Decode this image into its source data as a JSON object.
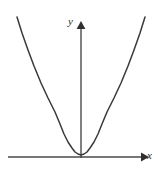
{
  "figure": {
    "name": "even-power-parabola-plot",
    "background_color": "#ffffff",
    "stroke_color": "#3a3a3a",
    "axis_color": "#4a4a4a"
  },
  "axes": {
    "x": {
      "label": "x",
      "arrow": "right-arrow-icon",
      "pixel_y": 157,
      "pixel_x_start": 8,
      "pixel_x_end": 148
    },
    "y": {
      "label": "y",
      "arrow": "up-arrow-icon",
      "pixel_x": 81,
      "pixel_y_start": 158,
      "pixel_y_end": 25
    },
    "origin": {
      "x": 81,
      "y": 157
    }
  },
  "chart_data": {
    "type": "line",
    "title": "",
    "xlabel": "x",
    "ylabel": "y",
    "grid": false,
    "legend": null,
    "annotations": [],
    "xlim": [
      -2.2,
      2.2
    ],
    "ylim": [
      0,
      22
    ],
    "axis_ticks": {
      "x": [],
      "y": []
    },
    "series": [
      {
        "name": "y = x^4 (steep even-power curve, vertex at origin)",
        "equation": "y = x^4",
        "x": [
          -2.05,
          -1.9,
          -1.75,
          -1.6,
          -1.45,
          -1.3,
          -1.15,
          -1.0,
          -0.85,
          -0.7,
          -0.55,
          -0.4,
          -0.25,
          0.0,
          0.25,
          0.4,
          0.55,
          0.7,
          0.85,
          1.0,
          1.15,
          1.3,
          1.45,
          1.6,
          1.75,
          1.9,
          2.05
        ],
        "y": [
          17.66,
          13.03,
          9.38,
          6.55,
          4.42,
          2.86,
          1.75,
          1.0,
          0.52,
          0.24,
          0.09,
          0.026,
          0.004,
          0.0,
          0.004,
          0.026,
          0.09,
          0.24,
          0.52,
          1.0,
          1.75,
          2.86,
          4.42,
          6.55,
          9.38,
          13.03,
          17.66
        ],
        "pixel_points": [
          [
            17,
            17
          ],
          [
            22,
            33
          ],
          [
            28,
            50
          ],
          [
            34,
            66
          ],
          [
            41,
            83
          ],
          [
            48,
            98
          ],
          [
            55,
            112
          ],
          [
            60,
            124
          ],
          [
            64,
            134
          ],
          [
            68,
            142
          ],
          [
            72,
            148
          ],
          [
            75,
            152
          ],
          [
            78,
            154
          ],
          [
            81,
            155
          ],
          [
            84,
            154
          ],
          [
            87,
            152
          ],
          [
            90,
            148
          ],
          [
            94,
            142
          ],
          [
            98,
            134
          ],
          [
            102,
            124
          ],
          [
            107,
            112
          ],
          [
            114,
            98
          ],
          [
            121,
            83
          ],
          [
            128,
            66
          ],
          [
            134,
            50
          ],
          [
            140,
            33
          ],
          [
            145,
            17
          ]
        ],
        "color": "#3a3a3a",
        "vertex": {
          "x": 0,
          "y": 0
        }
      }
    ]
  }
}
